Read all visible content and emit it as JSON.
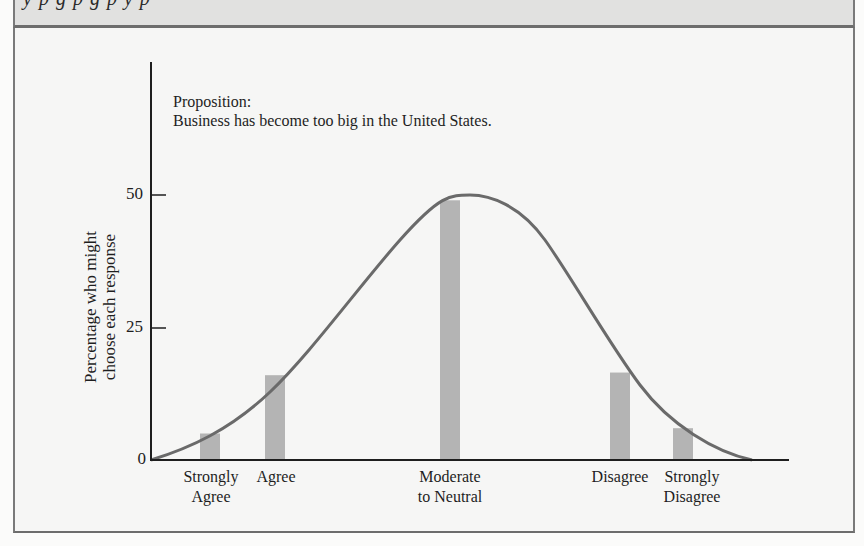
{
  "header": {
    "cutoff_text": "y p g p g p y p"
  },
  "chart_data": {
    "type": "bar",
    "title": "Proposition:",
    "subtitle": "Business has become too big in the United States.",
    "xlabel": "",
    "ylabel": "Percentage who might choose each response",
    "ylabel_lines": [
      "Percentage who might",
      "choose each response"
    ],
    "categories": [
      "Strongly Agree",
      "Agree",
      "Moderate to Neutral",
      "Disagree",
      "Strongly Disagree"
    ],
    "category_lines": [
      [
        "Strongly",
        "Agree"
      ],
      [
        "Agree"
      ],
      [
        "Moderate",
        "to Neutral"
      ],
      [
        "Disagree"
      ],
      [
        "Strongly",
        "Disagree"
      ]
    ],
    "values": [
      5,
      16,
      49,
      16.5,
      6
    ],
    "overlay": {
      "type": "line",
      "description": "Smooth bell-shaped curve over responses, peaking at 50 near Moderate to Neutral",
      "peak": 50
    },
    "yticks": [
      0,
      25,
      50
    ],
    "ylim": [
      0,
      60
    ],
    "grid": false,
    "legend": "none",
    "colors": {
      "bar": "#b4b4b4",
      "curve": "#6a6a6a",
      "axis": "#1e1e1e"
    }
  }
}
